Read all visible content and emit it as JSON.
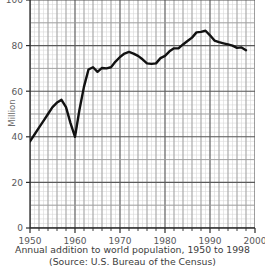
{
  "chart_data": {
    "type": "line",
    "title": "",
    "xlabel": "",
    "ylabel": "Million",
    "xlim": [
      1950,
      2000
    ],
    "ylim": [
      0,
      100
    ],
    "xticks": [
      1950,
      1960,
      1970,
      1980,
      1990,
      2000
    ],
    "xticklabels": [
      "1950",
      "1960",
      "1970",
      "1980",
      "1990",
      "2000"
    ],
    "yticks": [
      0,
      20,
      40,
      60,
      80,
      100
    ],
    "yticklabels": [
      "0",
      "20",
      "40",
      "60",
      "80",
      "100"
    ],
    "grid": true,
    "grid_minor": true,
    "legend": "none",
    "line_color": "#111111",
    "grid_color": "#b8b8b8",
    "grid_minor_color": "#d8d8d8",
    "series": [
      {
        "name": "Annual addition to world population",
        "x": [
          1950,
          1951,
          1952,
          1953,
          1954,
          1955,
          1956,
          1957,
          1958,
          1959,
          1960,
          1961,
          1962,
          1963,
          1964,
          1965,
          1966,
          1967,
          1968,
          1969,
          1970,
          1971,
          1972,
          1973,
          1974,
          1975,
          1976,
          1977,
          1978,
          1979,
          1980,
          1981,
          1982,
          1983,
          1984,
          1985,
          1986,
          1987,
          1988,
          1989,
          1990,
          1991,
          1992,
          1993,
          1994,
          1995,
          1996,
          1997,
          1998
        ],
        "values": [
          38.0,
          41.0,
          44.0,
          47.0,
          50.0,
          53.0,
          55.0,
          56.2,
          53.0,
          46.0,
          40.0,
          52.0,
          62.0,
          69.5,
          70.5,
          68.5,
          70.2,
          70.0,
          70.5,
          73.0,
          75.0,
          76.5,
          77.2,
          76.5,
          75.5,
          74.0,
          72.2,
          72.0,
          72.2,
          74.5,
          75.5,
          77.5,
          78.8,
          78.8,
          80.5,
          82.0,
          83.5,
          85.8,
          86.0,
          86.5,
          84.5,
          82.2,
          81.5,
          81.0,
          80.5,
          80.0,
          79.0,
          79.2,
          78.0
        ]
      }
    ],
    "caption_line1": "Annual addition to world population, 1950 to 1998",
    "caption_line2": "(Source: U.S. Bureau of the Census)"
  },
  "axis": {
    "y_axis_title": "Million"
  }
}
